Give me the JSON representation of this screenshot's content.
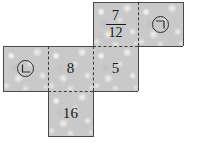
{
  "diagram": {
    "type": "cube-net",
    "background_color": "#ffffff",
    "face_fill_color": "#c9c9c9",
    "outline_color": "#4a4a4a",
    "fold_line_color": "#3c3c3c",
    "fold_line_style": "dashed",
    "face_size_px": 45,
    "faces": [
      {
        "id": "face-top-middle",
        "label": "7/12",
        "label_kind": "fraction",
        "numerator": "7",
        "denominator": "12",
        "row": 1,
        "column": 3,
        "x": 93,
        "y": 2
      },
      {
        "id": "face-top-right",
        "label": "㉠",
        "label_kind": "circled-mark",
        "mark": "giyeok",
        "row": 1,
        "column": 4,
        "x": 138,
        "y": 2
      },
      {
        "id": "face-middle-left",
        "label": "㉡",
        "label_kind": "circled-mark",
        "mark": "nieun",
        "row": 2,
        "column": 1,
        "x": 3,
        "y": 46
      },
      {
        "id": "face-middle-center",
        "label": "8",
        "label_kind": "number",
        "row": 2,
        "column": 2,
        "x": 48,
        "y": 46
      },
      {
        "id": "face-middle-right",
        "label": "5",
        "label_kind": "number",
        "row": 2,
        "column": 3,
        "x": 93,
        "y": 46
      },
      {
        "id": "face-bottom",
        "label": "16",
        "label_kind": "number",
        "row": 3,
        "column": 2,
        "x": 48,
        "y": 91
      }
    ]
  }
}
